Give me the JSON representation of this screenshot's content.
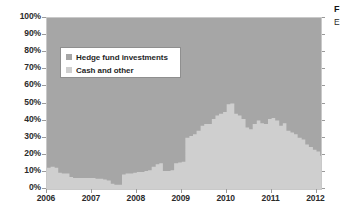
{
  "chart_data": {
    "type": "area",
    "stacked": true,
    "stack_mode": "percent",
    "title": "",
    "xlabel": "",
    "ylabel": "",
    "ylim": [
      0,
      100
    ],
    "xlim": [
      2006,
      2012.1
    ],
    "grid": false,
    "legend_position": "top-left inside plot",
    "y_ticks": [
      "0%",
      "10%",
      "20%",
      "30%",
      "40%",
      "50%",
      "60%",
      "70%",
      "80%",
      "90%",
      "100%"
    ],
    "y_tick_values": [
      0,
      10,
      20,
      30,
      40,
      50,
      60,
      70,
      80,
      90,
      100
    ],
    "x_ticks": [
      "2006",
      "2007",
      "2008",
      "2009",
      "2010",
      "2011",
      "2012"
    ],
    "x_tick_values": [
      2006,
      2007,
      2008,
      2009,
      2010,
      2011,
      2012
    ],
    "colors": {
      "hedge_fund_investments": "#a6a6a6",
      "cash_and_other": "#cfcfcf",
      "plot_background": "#b9b9b9",
      "axis_text": "#2b2b2b",
      "legend_border": "#8f8f8f"
    },
    "series": [
      {
        "name": "Cash and other",
        "color": "#cfcfcf",
        "stack_order": 0,
        "x": [
          2006.0,
          2006.08,
          2006.17,
          2006.25,
          2006.33,
          2006.42,
          2006.5,
          2006.58,
          2006.67,
          2006.75,
          2006.83,
          2006.92,
          2007.0,
          2007.08,
          2007.17,
          2007.25,
          2007.33,
          2007.42,
          2007.5,
          2007.58,
          2007.67,
          2007.75,
          2007.83,
          2007.92,
          2008.0,
          2008.08,
          2008.17,
          2008.25,
          2008.33,
          2008.42,
          2008.5,
          2008.58,
          2008.67,
          2008.75,
          2008.83,
          2008.92,
          2009.0,
          2009.08,
          2009.17,
          2009.25,
          2009.33,
          2009.42,
          2009.5,
          2009.58,
          2009.67,
          2009.75,
          2009.83,
          2009.92,
          2010.0,
          2010.08,
          2010.17,
          2010.25,
          2010.33,
          2010.42,
          2010.5,
          2010.58,
          2010.67,
          2010.75,
          2010.83,
          2010.92,
          2011.0,
          2011.08,
          2011.17,
          2011.25,
          2011.33,
          2011.42,
          2011.5,
          2011.58,
          2011.67,
          2011.75,
          2011.83,
          2011.92,
          2012.0,
          2012.08
        ],
        "values": [
          12.5,
          13.0,
          12.5,
          9.5,
          9.0,
          9.0,
          7.0,
          6.5,
          6.5,
          6.5,
          6.5,
          6.5,
          6.5,
          6.0,
          6.0,
          5.5,
          5.0,
          3.0,
          2.5,
          2.5,
          8.5,
          9.0,
          9.0,
          9.5,
          10.0,
          10.0,
          10.5,
          11.0,
          13.0,
          14.5,
          15.0,
          10.5,
          10.5,
          11.0,
          15.0,
          15.5,
          16.0,
          30.0,
          31.0,
          32.0,
          34.0,
          37.0,
          38.0,
          38.0,
          41.0,
          43.0,
          44.0,
          45.0,
          49.5,
          50.0,
          44.0,
          43.0,
          41.0,
          36.0,
          35.0,
          38.0,
          40.0,
          38.5,
          38.0,
          41.0,
          41.5,
          40.0,
          37.0,
          38.5,
          34.0,
          33.0,
          32.0,
          30.0,
          29.0,
          26.0,
          24.5,
          23.0,
          22.0,
          19.5
        ]
      },
      {
        "name": "Hedge fund investments",
        "color": "#a6a6a6",
        "stack_order": 1,
        "x": [
          2006.0,
          2006.08,
          2006.17,
          2006.25,
          2006.33,
          2006.42,
          2006.5,
          2006.58,
          2006.67,
          2006.75,
          2006.83,
          2006.92,
          2007.0,
          2007.08,
          2007.17,
          2007.25,
          2007.33,
          2007.42,
          2007.5,
          2007.58,
          2007.67,
          2007.75,
          2007.83,
          2007.92,
          2008.0,
          2008.08,
          2008.17,
          2008.25,
          2008.33,
          2008.42,
          2008.5,
          2008.58,
          2008.67,
          2008.75,
          2008.83,
          2008.92,
          2009.0,
          2009.08,
          2009.17,
          2009.25,
          2009.33,
          2009.42,
          2009.5,
          2009.58,
          2009.67,
          2009.75,
          2009.83,
          2009.92,
          2010.0,
          2010.08,
          2010.17,
          2010.25,
          2010.33,
          2010.42,
          2010.5,
          2010.58,
          2010.67,
          2010.75,
          2010.83,
          2010.92,
          2011.0,
          2011.08,
          2011.17,
          2011.25,
          2011.33,
          2011.42,
          2011.5,
          2011.58,
          2011.67,
          2011.75,
          2011.83,
          2011.92,
          2012.0,
          2012.08
        ],
        "values": [
          87.5,
          87.0,
          87.5,
          90.5,
          91.0,
          91.0,
          93.0,
          93.5,
          93.5,
          93.5,
          93.5,
          93.5,
          93.5,
          94.0,
          94.0,
          94.5,
          95.0,
          97.0,
          97.5,
          97.5,
          91.5,
          91.0,
          91.0,
          90.5,
          90.0,
          90.0,
          89.5,
          89.0,
          87.0,
          85.5,
          85.0,
          89.5,
          89.5,
          89.0,
          85.0,
          84.5,
          84.0,
          70.0,
          69.0,
          68.0,
          66.0,
          63.0,
          62.0,
          62.0,
          59.0,
          57.0,
          56.0,
          55.0,
          50.5,
          50.0,
          56.0,
          57.0,
          59.0,
          64.0,
          65.0,
          62.0,
          60.0,
          61.5,
          62.0,
          59.0,
          58.5,
          60.0,
          63.0,
          61.5,
          66.0,
          67.0,
          68.0,
          70.0,
          71.0,
          74.0,
          75.5,
          77.0,
          78.0,
          80.5
        ]
      }
    ]
  },
  "legend": {
    "items": [
      {
        "label": "Hedge fund investments",
        "color": "#a6a6a6"
      },
      {
        "label": "Cash and other",
        "color": "#cfcfcf"
      }
    ]
  },
  "side_caption": {
    "title": "F",
    "subtitle": "E"
  }
}
